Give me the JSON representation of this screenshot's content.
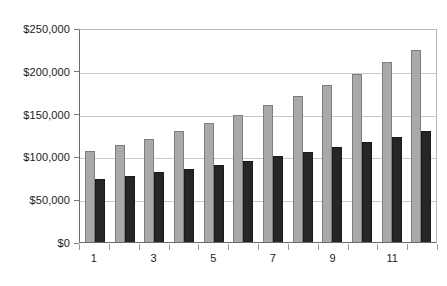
{
  "chart_data": {
    "type": "bar",
    "title": "",
    "subtitle": "",
    "xlabel": "",
    "ylabel": "",
    "categories": [
      "1",
      "2",
      "3",
      "4",
      "5",
      "6",
      "7",
      "8",
      "9",
      "10",
      "11",
      "12"
    ],
    "visible_tick_labels": [
      "1",
      "3",
      "5",
      "7",
      "9",
      "11"
    ],
    "series": [
      {
        "name": "series-a",
        "color": "#a9a9a9",
        "values": [
          107000,
          114000,
          122000,
          131000,
          140000,
          150000,
          161000,
          172000,
          185000,
          198000,
          212000,
          227000
        ]
      },
      {
        "name": "series-b",
        "color": "#262626",
        "values": [
          74000,
          78000,
          82000,
          86000,
          91000,
          96000,
          101000,
          106000,
          112000,
          118000,
          124000,
          131000
        ]
      }
    ],
    "ylim": [
      0,
      250000
    ],
    "ytick_values": [
      0,
      50000,
      100000,
      150000,
      200000,
      250000
    ],
    "ytick_labels": [
      "$0",
      "$50,000",
      "$100,000",
      "$150,000",
      "$200,000",
      "$250,000"
    ],
    "grid": true,
    "grid_axis": "y",
    "legend": false,
    "legend_position": "none",
    "background_color": "#ffffff",
    "plot_border_color": "#6b6b6b",
    "gridline_color": "#c8c8c8"
  }
}
